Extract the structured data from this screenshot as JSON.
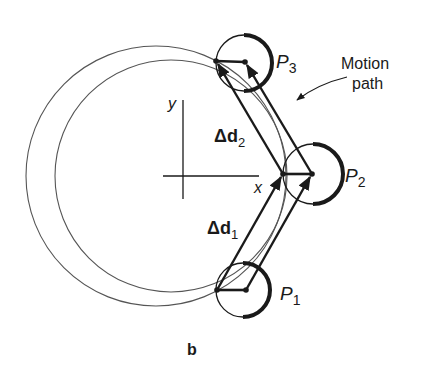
{
  "figure": {
    "panel_label": "b",
    "axes": {
      "x_label": "x",
      "y_label": "y"
    },
    "points": [
      {
        "id": "P1",
        "letter": "P",
        "subscript": "1"
      },
      {
        "id": "P2",
        "letter": "P",
        "subscript": "2"
      },
      {
        "id": "P3",
        "letter": "P",
        "subscript": "3"
      }
    ],
    "displacements": [
      {
        "id": "d1",
        "symbol": "Δd",
        "subscript": "1"
      },
      {
        "id": "d2",
        "symbol": "Δd",
        "subscript": "2"
      }
    ],
    "annotation": {
      "line1": "Motion",
      "line2": "path"
    },
    "colors": {
      "ink": "#1a1a1a",
      "thin_line": "#555555",
      "background": "#ffffff"
    }
  }
}
